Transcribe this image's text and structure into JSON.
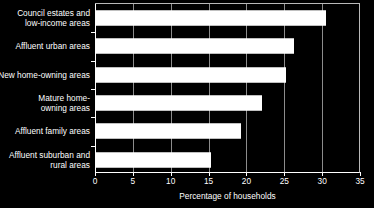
{
  "chart_data": {
    "type": "bar",
    "orientation": "horizontal",
    "title": "",
    "xlabel": "Percentage of households",
    "ylabel": "",
    "xlim": [
      0,
      35
    ],
    "xticks": [
      0,
      5,
      10,
      15,
      20,
      25,
      30,
      35
    ],
    "xtick_labels": [
      "0",
      "5",
      "10",
      "15",
      "20",
      "25",
      "30",
      "35"
    ],
    "grid": true,
    "grid_axis": "x",
    "legend": false,
    "categories": [
      "Council estates and\nlow-income areas",
      "Affluent urban areas",
      "New home-owning areas",
      "Mature home-\nowning areas",
      "Affluent family areas",
      "Affluent suburban and\nrural areas"
    ],
    "values": [
      30.5,
      26.3,
      25.2,
      22.1,
      19.3,
      15.3
    ],
    "bar_color": "#ffffff",
    "background_color": "#000000",
    "text_color": "#ffffff",
    "grid_color": "#8c8c8c",
    "axis_color": "#ffffff"
  }
}
